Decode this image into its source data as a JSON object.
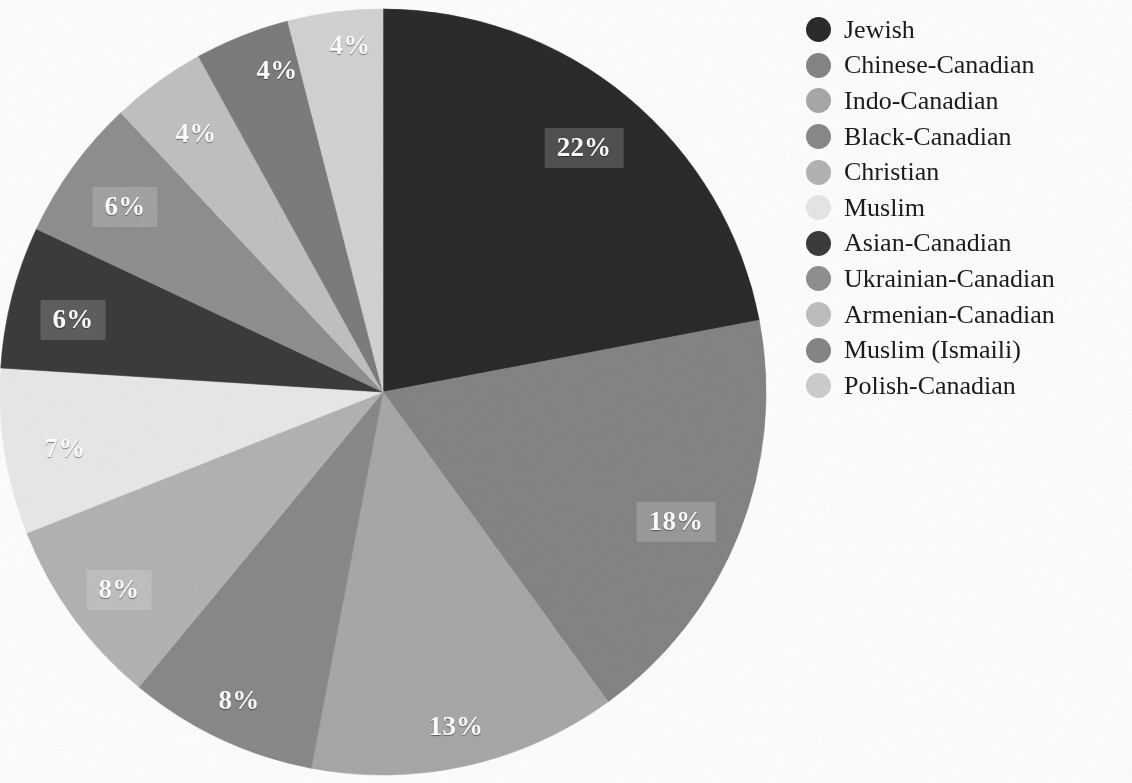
{
  "figure": {
    "background_color": "#ffffff",
    "label_text_color": "#ffffff",
    "legend_text_color": "#1b1b1b"
  },
  "chart_data": {
    "type": "pie",
    "title": "",
    "subtitle": "",
    "xlabel": "",
    "ylabel": "",
    "grid": false,
    "legend_position": "right",
    "value_suffix": "%",
    "start_angle_deg": 0,
    "direction": "clockwise",
    "center": {
      "x": 383,
      "y": 392
    },
    "radius": 383,
    "categories": [
      "Jewish",
      "Chinese-Canadian",
      "Indo-Canadian",
      "Black-Canadian",
      "Christian",
      "Muslim",
      "Asian-Canadian",
      "Ukrainian-Canadian",
      "Armenian-Canadian",
      "Muslim (Ismaili)",
      "Polish-Canadian"
    ],
    "values": [
      22,
      18,
      13,
      8,
      8,
      7,
      6,
      6,
      4,
      4,
      4
    ],
    "value_labels": [
      "22%",
      "18%",
      "13%",
      "8%",
      "8%",
      "7%",
      "6%",
      "6%",
      "4%",
      "4%",
      "4%"
    ],
    "colors": [
      "#2b2b2b",
      "#858585",
      "#a9a9a9",
      "#8a8a8a",
      "#b4b4b4",
      "#eaeaea",
      "#3c3c3c",
      "#909090",
      "#c2c2c2",
      "#7d7d7d",
      "#d4d4d4"
    ],
    "slices": [
      {
        "label": "Jewish",
        "value": 22,
        "value_label": "22%",
        "color": "#2b2b2b",
        "label_x": 584,
        "label_y": 148,
        "boxed": true
      },
      {
        "label": "Chinese-Canadian",
        "value": 18,
        "value_label": "18%",
        "color": "#858585",
        "label_x": 676,
        "label_y": 522,
        "boxed": true
      },
      {
        "label": "Indo-Canadian",
        "value": 13,
        "value_label": "13%",
        "color": "#a9a9a9",
        "label_x": 456,
        "label_y": 726,
        "boxed": false
      },
      {
        "label": "Black-Canadian",
        "value": 8,
        "value_label": "8%",
        "color": "#8a8a8a",
        "label_x": 239,
        "label_y": 700,
        "boxed": false
      },
      {
        "label": "Christian",
        "value": 8,
        "value_label": "8%",
        "color": "#b4b4b4",
        "label_x": 119,
        "label_y": 590,
        "boxed": true
      },
      {
        "label": "Muslim",
        "value": 7,
        "value_label": "7%",
        "color": "#eaeaea",
        "label_x": 65,
        "label_y": 448,
        "boxed": false
      },
      {
        "label": "Asian-Canadian",
        "value": 6,
        "value_label": "6%",
        "color": "#3c3c3c",
        "label_x": 73,
        "label_y": 320,
        "boxed": true
      },
      {
        "label": "Ukrainian-Canadian",
        "value": 6,
        "value_label": "6%",
        "color": "#909090",
        "label_x": 125,
        "label_y": 207,
        "boxed": true
      },
      {
        "label": "Armenian-Canadian",
        "value": 4,
        "value_label": "4%",
        "color": "#c2c2c2",
        "label_x": 196,
        "label_y": 133,
        "boxed": false
      },
      {
        "label": "Muslim (Ismaili)",
        "value": 4,
        "value_label": "4%",
        "color": "#7d7d7d",
        "label_x": 277,
        "label_y": 70,
        "boxed": false
      },
      {
        "label": "Polish-Canadian",
        "value": 4,
        "value_label": "4%",
        "color": "#d4d4d4",
        "label_x": 350,
        "label_y": 45,
        "boxed": false
      }
    ]
  },
  "legend": {
    "items": [
      {
        "label": "Jewish",
        "color": "#2b2b2b"
      },
      {
        "label": "Chinese-Canadian",
        "color": "#868686"
      },
      {
        "label": "Indo-Canadian",
        "color": "#a9a9a9"
      },
      {
        "label": "Black-Canadian",
        "color": "#8a8a8a"
      },
      {
        "label": "Christian",
        "color": "#b4b4b4"
      },
      {
        "label": "Muslim",
        "color": "#e8e8e8"
      },
      {
        "label": "Asian-Canadian",
        "color": "#3c3c3c"
      },
      {
        "label": "Ukrainian-Canadian",
        "color": "#909090"
      },
      {
        "label": "Armenian-Canadian",
        "color": "#c0c0c0"
      },
      {
        "label": "Muslim (Ismaili)",
        "color": "#878787"
      },
      {
        "label": "Polish-Canadian",
        "color": "#cfcfcf"
      }
    ]
  }
}
